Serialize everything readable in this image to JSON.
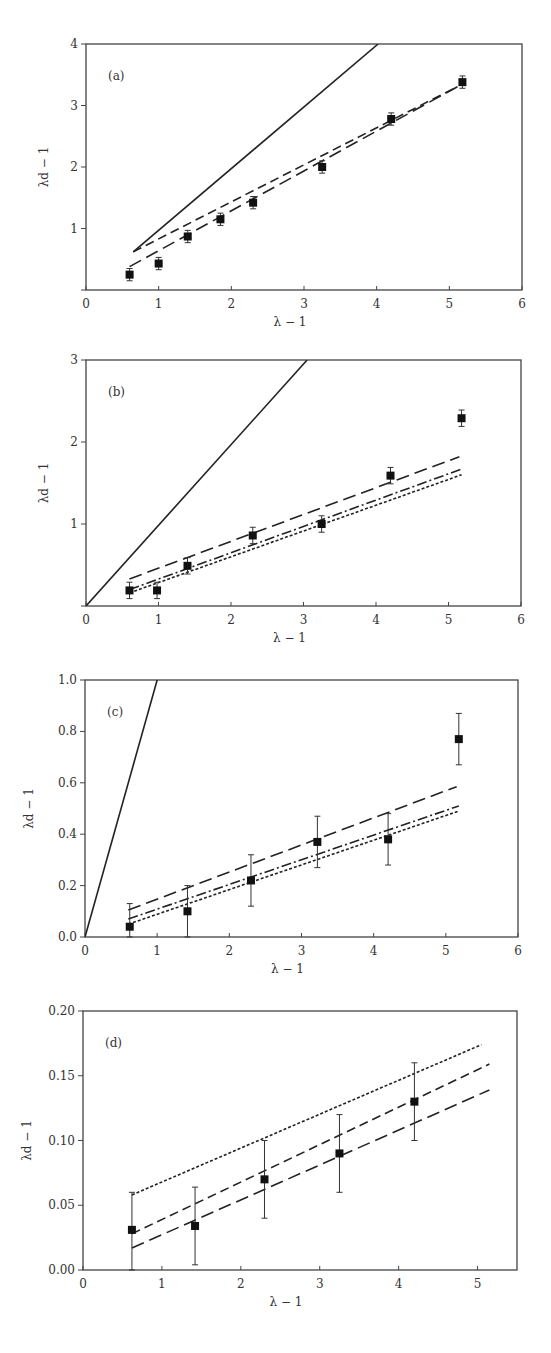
{
  "chart_data": [
    {
      "panel": "(a)",
      "type": "scatter",
      "xlabel": "λ − 1",
      "ylabel": "λd − 1",
      "xlim": [
        0,
        6
      ],
      "ylim": [
        0,
        4
      ],
      "xticks": [
        "0",
        "1",
        "2",
        "3",
        "4",
        "5",
        "6"
      ],
      "yticks": [
        "",
        "1",
        "2",
        "3",
        "4"
      ],
      "frame": {
        "x0": 86,
        "x1": 522,
        "y0": 290,
        "y1": 44
      },
      "points": [
        {
          "x": 0.6,
          "y": 0.25,
          "err": 0.1
        },
        {
          "x": 1.0,
          "y": 0.43,
          "err": 0.1
        },
        {
          "x": 1.4,
          "y": 0.87,
          "err": 0.1
        },
        {
          "x": 1.85,
          "y": 1.15,
          "err": 0.1
        },
        {
          "x": 2.3,
          "y": 1.42,
          "err": 0.1
        },
        {
          "x": 3.25,
          "y": 2.0,
          "err": 0.1
        },
        {
          "x": 4.2,
          "y": 2.78,
          "err": 0.1
        },
        {
          "x": 5.18,
          "y": 3.38,
          "err": 0.1
        }
      ],
      "lines": [
        {
          "name": "solid",
          "style": "solid",
          "x": [
            0.65,
            4.02
          ],
          "y": [
            0.62,
            4.0
          ]
        },
        {
          "name": "dashed-short",
          "style": "dash-medium",
          "x": [
            0.65,
            5.1
          ],
          "y": [
            0.62,
            3.3
          ]
        },
        {
          "name": "dashed-long",
          "style": "dash-long",
          "x": [
            0.6,
            5.18
          ],
          "y": [
            0.38,
            3.35
          ]
        }
      ]
    },
    {
      "panel": "(b)",
      "type": "scatter",
      "xlabel": "λ − 1",
      "ylabel": "λd − 1",
      "xlim": [
        0,
        6
      ],
      "ylim": [
        0,
        3
      ],
      "xticks": [
        "0",
        "1",
        "2",
        "3",
        "4",
        "5",
        "6"
      ],
      "yticks": [
        "",
        "1",
        "2",
        "3"
      ],
      "frame": {
        "x0": 86,
        "x1": 521,
        "y0": 606,
        "y1": 360
      },
      "points": [
        {
          "x": 0.6,
          "y": 0.19,
          "err": 0.1
        },
        {
          "x": 0.98,
          "y": 0.19,
          "err": 0.1
        },
        {
          "x": 1.4,
          "y": 0.49,
          "err": 0.1
        },
        {
          "x": 2.3,
          "y": 0.86,
          "err": 0.1
        },
        {
          "x": 3.25,
          "y": 1.0,
          "err": 0.1
        },
        {
          "x": 4.2,
          "y": 1.59,
          "err": 0.1
        },
        {
          "x": 5.18,
          "y": 2.29,
          "err": 0.1
        }
      ],
      "lines": [
        {
          "name": "solid",
          "style": "solid",
          "x": [
            0,
            3.05
          ],
          "y": [
            0,
            3.0
          ]
        },
        {
          "name": "dash-dot-long",
          "style": "dash-long",
          "x": [
            0.6,
            5.15
          ],
          "y": [
            0.33,
            1.82
          ]
        },
        {
          "name": "dash-dot-medium",
          "style": "dash-dot",
          "x": [
            0.6,
            5.18
          ],
          "y": [
            0.2,
            1.67
          ]
        },
        {
          "name": "dotted-short",
          "style": "dash-short",
          "x": [
            0.6,
            5.18
          ],
          "y": [
            0.16,
            1.6
          ]
        }
      ]
    },
    {
      "panel": "(c)",
      "type": "scatter",
      "xlabel": "λ − 1",
      "ylabel": "λd − 1",
      "xlim": [
        0,
        6
      ],
      "ylim": [
        0,
        1.0
      ],
      "xticks": [
        "0",
        "1",
        "2",
        "3",
        "4",
        "5",
        "6"
      ],
      "yticks": [
        "0.0",
        "0.2",
        "0.4",
        "0.6",
        "0.8",
        "1.0"
      ],
      "frame": {
        "x0": 85,
        "x1": 518,
        "y0": 937,
        "y1": 680
      },
      "points": [
        {
          "x": 0.62,
          "y": 0.04,
          "err_lo": 0.04,
          "err_hi": 0.09
        },
        {
          "x": 1.42,
          "y": 0.1,
          "err": 0.1
        },
        {
          "x": 2.3,
          "y": 0.22,
          "err": 0.1
        },
        {
          "x": 3.22,
          "y": 0.37,
          "err": 0.1
        },
        {
          "x": 4.2,
          "y": 0.38,
          "err": 0.1
        },
        {
          "x": 5.18,
          "y": 0.77,
          "err": 0.1
        }
      ],
      "lines": [
        {
          "name": "solid",
          "style": "solid",
          "x": [
            0,
            1.0
          ],
          "y": [
            0,
            1.0
          ]
        },
        {
          "name": "dashed-long",
          "style": "dash-long",
          "x": [
            0.6,
            5.15
          ],
          "y": [
            0.105,
            0.585
          ]
        },
        {
          "name": "dash-dot",
          "style": "dash-dot",
          "x": [
            0.6,
            5.18
          ],
          "y": [
            0.07,
            0.51
          ]
        },
        {
          "name": "dotted-short",
          "style": "dash-short",
          "x": [
            0.6,
            5.18
          ],
          "y": [
            0.05,
            0.49
          ]
        }
      ]
    },
    {
      "panel": "(d)",
      "type": "scatter",
      "xlabel": "λ − 1",
      "ylabel": "λd − 1",
      "xlim": [
        0,
        5.5
      ],
      "ylim": [
        0,
        0.2
      ],
      "xticks": [
        "0",
        "1",
        "2",
        "3",
        "4",
        "5"
      ],
      "yticks": [
        "0.00",
        "0.05",
        "0.10",
        "0.15",
        "0.20"
      ],
      "frame": {
        "x0": 83,
        "x1": 517,
        "y0": 1270,
        "y1": 1011
      },
      "points": [
        {
          "x": 0.62,
          "y": 0.031,
          "err_lo": 0.031,
          "err_hi": 0.029
        },
        {
          "x": 1.42,
          "y": 0.034,
          "err": 0.03
        },
        {
          "x": 2.3,
          "y": 0.07,
          "err": 0.03
        },
        {
          "x": 3.25,
          "y": 0.09,
          "err": 0.03
        },
        {
          "x": 4.2,
          "y": 0.13,
          "err": 0.03
        }
      ],
      "lines": [
        {
          "name": "dotted-short",
          "style": "dash-short",
          "x": [
            0.62,
            5.05
          ],
          "y": [
            0.058,
            0.174
          ]
        },
        {
          "name": "dashed-medium",
          "style": "dash-medium",
          "x": [
            0.62,
            5.15
          ],
          "y": [
            0.028,
            0.159
          ]
        },
        {
          "name": "dashed-long",
          "style": "dash-long",
          "x": [
            0.62,
            5.15
          ],
          "y": [
            0.017,
            0.139
          ]
        }
      ]
    }
  ]
}
